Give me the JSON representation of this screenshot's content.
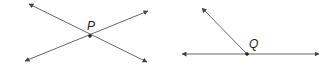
{
  "figures": [
    {
      "id": "intersecting-lines",
      "point_label": "P",
      "description": "Two lines intersecting at point P"
    },
    {
      "id": "ray-on-line",
      "point_label": "Q",
      "description": "A ray from point Q on a line"
    }
  ],
  "colors": {
    "line": "#555555",
    "point": "#222222",
    "background": "#ffffff"
  }
}
